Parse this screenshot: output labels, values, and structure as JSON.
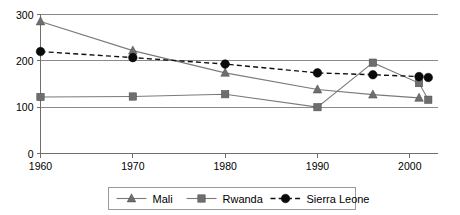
{
  "chart_data": {
    "type": "line",
    "title": "",
    "subtitle": "",
    "xlabel": "",
    "ylabel": "",
    "xlim": [
      1960,
      2003
    ],
    "ylim": [
      0,
      300
    ],
    "xticks": [
      "1960",
      "1970",
      "1980",
      "1990",
      "2000"
    ],
    "xtick_values": [
      1960,
      1970,
      1980,
      1990,
      2000
    ],
    "yticks": [
      "0",
      "100",
      "200",
      "300"
    ],
    "ytick_values": [
      0,
      100,
      200,
      300
    ],
    "grid": true,
    "legend_position": "bottom",
    "series": [
      {
        "name": "Mali",
        "marker": "triangle",
        "line_style": "solid",
        "color": "#6e6e6e",
        "x": [
          1960,
          1970,
          1980,
          1990,
          1996,
          2001
        ],
        "values": [
          285,
          222,
          174,
          138,
          127,
          120
        ]
      },
      {
        "name": "Rwanda",
        "marker": "square",
        "line_style": "solid",
        "color": "#6e6e6e",
        "x": [
          1960,
          1970,
          1980,
          1990,
          1996,
          2001,
          2002
        ],
        "values": [
          122,
          123,
          128,
          100,
          196,
          152,
          116
        ]
      },
      {
        "name": "Sierra Leone",
        "marker": "circle",
        "line_style": "dashed",
        "color": "#0a0a0a",
        "x": [
          1960,
          1970,
          1980,
          1990,
          1996,
          2001,
          2002
        ],
        "values": [
          220,
          207,
          193,
          174,
          170,
          166,
          164
        ]
      }
    ]
  },
  "legend": {
    "items": [
      {
        "label": "Mali"
      },
      {
        "label": "Rwanda"
      },
      {
        "label": "Sierra Leone"
      }
    ]
  },
  "axes": {
    "y_labels": [
      "300",
      "200",
      "100",
      "0"
    ],
    "x_labels": [
      "1960",
      "1970",
      "1980",
      "1990",
      "2000"
    ]
  }
}
